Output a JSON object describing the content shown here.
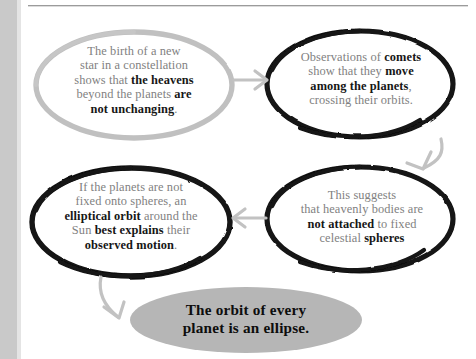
{
  "diagram": {
    "colors": {
      "outline_black": "#121212",
      "outline_gray": "#c0c0c0",
      "arrow_gray": "#c2c2c2",
      "fill_gray": "#b6b6b6",
      "body_text": "#818181",
      "emphasis_text": "#161616"
    },
    "nodes": [
      {
        "id": "new-star",
        "outline": "gray",
        "lines": [
          [
            {
              "t": "The birth of a new",
              "b": false
            }
          ],
          [
            {
              "t": "star in a constellation",
              "b": false
            }
          ],
          [
            {
              "t": "shows that ",
              "b": false
            },
            {
              "t": "the heavens",
              "b": true
            }
          ],
          [
            {
              "t": "beyond the planets ",
              "b": false
            },
            {
              "t": "are",
              "b": true
            }
          ],
          [
            {
              "t": "not unchanging",
              "b": true
            },
            {
              "t": ".",
              "b": false
            }
          ]
        ]
      },
      {
        "id": "comets",
        "outline": "black",
        "lines": [
          [
            {
              "t": "Observations of ",
              "b": false
            },
            {
              "t": "comets",
              "b": true
            }
          ],
          [
            {
              "t": "show that they ",
              "b": false
            },
            {
              "t": "move",
              "b": true
            }
          ],
          [
            {
              "t": "among the planets",
              "b": true
            },
            {
              "t": ",",
              "b": false
            }
          ],
          [
            {
              "t": "crossing their orbits.",
              "b": false
            }
          ]
        ]
      },
      {
        "id": "not-attached",
        "outline": "black",
        "lines": [
          [
            {
              "t": "This suggests",
              "b": false
            }
          ],
          [
            {
              "t": "that heavenly bodies are",
              "b": false
            }
          ],
          [
            {
              "t": "not attached",
              "b": true
            },
            {
              "t": " to fixed",
              "b": false
            }
          ],
          [
            {
              "t": "celestial ",
              "b": false
            },
            {
              "t": "spheres",
              "b": true
            }
          ]
        ]
      },
      {
        "id": "elliptical-orbit",
        "outline": "black",
        "lines": [
          [
            {
              "t": "If the planets are not",
              "b": false
            }
          ],
          [
            {
              "t": "fixed onto spheres, an",
              "b": false
            }
          ],
          [
            {
              "t": "elliptical orbit",
              "b": true
            },
            {
              "t": " around the",
              "b": false
            }
          ],
          [
            {
              "t": "Sun ",
              "b": false
            },
            {
              "t": "best explains",
              "b": true
            },
            {
              "t": " their",
              "b": false
            }
          ],
          [
            {
              "t": "observed motion",
              "b": true
            },
            {
              "t": ".",
              "b": false
            }
          ]
        ]
      },
      {
        "id": "conclusion",
        "outline": "filled-gray",
        "lines": [
          [
            {
              "t": "The orbit of every",
              "b": true
            }
          ],
          [
            {
              "t": "planet is an ellipse.",
              "b": true
            }
          ]
        ]
      }
    ],
    "arrows": [
      {
        "id": "star-to-comets",
        "direction": "right"
      },
      {
        "id": "comets-to-spheres",
        "direction": "down-left"
      },
      {
        "id": "spheres-to-orbit",
        "direction": "left"
      },
      {
        "id": "orbit-to-conclusion",
        "direction": "down-right"
      }
    ]
  }
}
